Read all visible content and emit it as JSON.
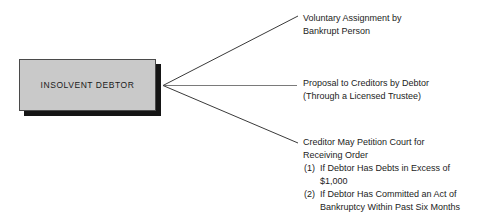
{
  "diagram": {
    "background_color": "#ffffff",
    "source": {
      "label": "INSOLVENT DEBTOR",
      "fill_color": "#c9c9c9",
      "border_color": "#4a4a4a",
      "shadow_color": "#151515"
    },
    "connector_color": "#3a3a3a",
    "branches": [
      {
        "id": "voluntary-assignment",
        "lines": [
          "Voluntary Assignment by",
          "Bankrupt Person"
        ]
      },
      {
        "id": "proposal-to-creditors",
        "lines": [
          "Proposal to Creditors by Debtor",
          "(Through a Licensed Trustee)"
        ]
      },
      {
        "id": "creditor-petition",
        "lines": [
          "Creditor May Petition Court for",
          "Receiving Order"
        ],
        "sub_items": [
          {
            "marker": "(1)",
            "text": "If Debtor Has Debts in Excess of",
            "continuation": "$1,000"
          },
          {
            "marker": "(2)",
            "text": "If Debtor Has Committed an Act of",
            "continuation": "Bankruptcy Within Past Six Months"
          }
        ]
      }
    ]
  }
}
